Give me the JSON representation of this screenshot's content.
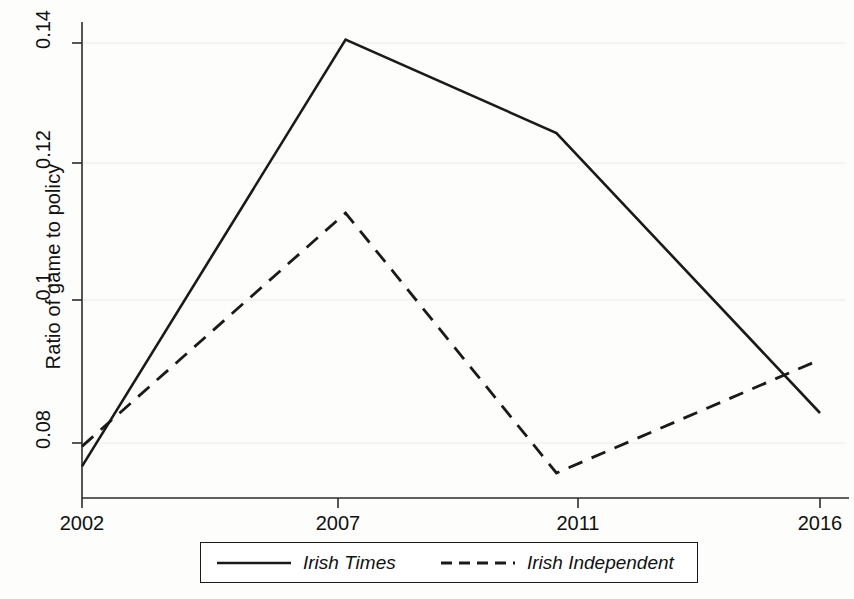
{
  "chart_data": {
    "type": "line",
    "title": "",
    "subtitle": "",
    "xlabel": "",
    "ylabel": "Ratio of game to policy",
    "x": [
      2002,
      2007,
      2011,
      2016
    ],
    "xticklabels": [
      "2002",
      "2007",
      "2011",
      "2016"
    ],
    "yticklabels": [
      "0.08",
      "0.1",
      "0.12",
      "0.14"
    ],
    "yticks": [
      0.08,
      0.1,
      0.12,
      0.14
    ],
    "xlim": [
      2002,
      2016
    ],
    "ylim": [
      0.0735,
      0.1425
    ],
    "grid": "faint-horizontal",
    "legend_position": "below-axes-center",
    "series": [
      {
        "name": "Irish Times",
        "style": "solid",
        "color": "#1a1a1a",
        "values": [
          0.0765,
          0.1405,
          0.1265,
          0.0845
        ]
      },
      {
        "name": "Irish Independent",
        "style": "dashed",
        "color": "#1a1a1a",
        "values": [
          0.0795,
          0.1145,
          0.0755,
          0.0925
        ]
      }
    ]
  },
  "axes": {
    "y_title": "Ratio of game to policy",
    "y_tick_0": "0.08",
    "y_tick_1": "0.1",
    "y_tick_2": "0.12",
    "y_tick_3": "0.14",
    "x_tick_0": "2002",
    "x_tick_1": "2007",
    "x_tick_2": "2011",
    "x_tick_3": "2016"
  },
  "legend": {
    "entry_0_label": "Irish Times",
    "entry_1_label": "Irish Independent"
  },
  "colors": {
    "line": "#1a1a1a",
    "axis": "#2b2b2b",
    "grid": "#ececec",
    "background": "#fdfdfc"
  }
}
